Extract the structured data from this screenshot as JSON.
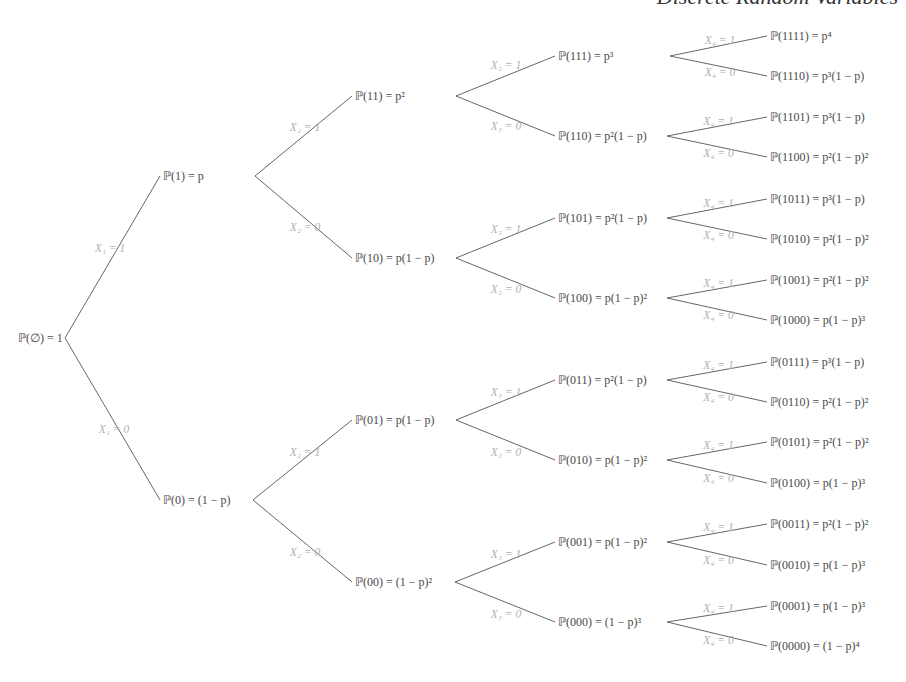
{
  "header": {
    "title": "Discrete Random Variables"
  },
  "tree": {
    "root": {
      "label": "ℙ(∅) = 1",
      "x": 18,
      "y": 338,
      "bx": 65
    },
    "levels": [
      {
        "nodes": [
          {
            "id": "1",
            "label": "ℙ(1) = p",
            "x": 163,
            "y": 176,
            "bx": 255,
            "edge": "X₁ = 1",
            "ex": 110,
            "ey": 248
          },
          {
            "id": "0",
            "label": "ℙ(0) = (1 − p)",
            "x": 163,
            "y": 500,
            "bx": 253,
            "edge": "X₁ = 0",
            "ex": 114,
            "ey": 429
          }
        ]
      },
      {
        "nodes": [
          {
            "id": "11",
            "label": "ℙ(11) = p²",
            "x": 355,
            "y": 96,
            "bx": 456,
            "edge": "X₂ = 1",
            "ex": 305,
            "ey": 127,
            "parent": 0
          },
          {
            "id": "10",
            "label": "ℙ(10) = p(1 − p)",
            "x": 355,
            "y": 258,
            "bx": 456,
            "edge": "X₂ = 0",
            "ex": 305,
            "ey": 227,
            "parent": 0
          },
          {
            "id": "01",
            "label": "ℙ(01) = p(1 − p)",
            "x": 355,
            "y": 420,
            "bx": 456,
            "edge": "X₂ = 1",
            "ex": 305,
            "ey": 452,
            "parent": 1
          },
          {
            "id": "00",
            "label": "ℙ(00) = (1 − p)²",
            "x": 355,
            "y": 582,
            "bx": 455,
            "edge": "X₂ = 0",
            "ex": 305,
            "ey": 552,
            "parent": 1
          }
        ]
      },
      {
        "nodes": [
          {
            "id": "111",
            "label": "ℙ(111) = p³",
            "x": 558,
            "y": 56,
            "bx": 670,
            "edge": "X₃ = 1",
            "ex": 506,
            "ey": 65,
            "parent": 0
          },
          {
            "id": "110",
            "label": "ℙ(110) = p²(1 − p)",
            "x": 558,
            "y": 136,
            "bx": 667,
            "edge": "X₃ = 0",
            "ex": 506,
            "ey": 126,
            "parent": 0
          },
          {
            "id": "101",
            "label": "ℙ(101) = p²(1 − p)",
            "x": 558,
            "y": 218,
            "bx": 667,
            "edge": "X₃ = 1",
            "ex": 506,
            "ey": 229,
            "parent": 1
          },
          {
            "id": "100",
            "label": "ℙ(100) = p(1 − p)²",
            "x": 558,
            "y": 298,
            "bx": 667,
            "edge": "X₃ = 0",
            "ex": 506,
            "ey": 289,
            "parent": 1
          },
          {
            "id": "011",
            "label": "ℙ(011) = p²(1 − p)",
            "x": 558,
            "y": 380,
            "bx": 667,
            "edge": "X₃ = 1",
            "ex": 506,
            "ey": 392,
            "parent": 2
          },
          {
            "id": "010",
            "label": "ℙ(010) = p(1 − p)²",
            "x": 558,
            "y": 460,
            "bx": 667,
            "edge": "X₃ = 0",
            "ex": 506,
            "ey": 452,
            "parent": 2
          },
          {
            "id": "001",
            "label": "ℙ(001) = p(1 − p)²",
            "x": 558,
            "y": 542,
            "bx": 667,
            "edge": "X₃ = 1",
            "ex": 506,
            "ey": 554,
            "parent": 3
          },
          {
            "id": "000",
            "label": "ℙ(000) = (1 − p)³",
            "x": 558,
            "y": 622,
            "bx": 667,
            "edge": "X₃ = 0",
            "ex": 506,
            "ey": 614,
            "parent": 3
          }
        ]
      },
      {
        "nodes": [
          {
            "id": "1111",
            "label": "ℙ(1111) = p⁴",
            "x": 770,
            "y": 36,
            "edge": "X₄ = 1",
            "ex": 720,
            "ey": 36,
            "parent": 0
          },
          {
            "id": "1110",
            "label": "ℙ(1110) = p³(1 − p)",
            "x": 770,
            "y": 76,
            "edge": "X₄ = 0",
            "ex": 720,
            "ey": 76,
            "parent": 0
          },
          {
            "id": "1101",
            "label": "ℙ(1101) = p³(1 − p)",
            "x": 770,
            "y": 117,
            "edge": "X₄ = 1",
            "ex": 720,
            "ey": 117,
            "parent": 1
          },
          {
            "id": "1100",
            "label": "ℙ(1100) = p²(1 − p)²",
            "x": 770,
            "y": 157,
            "edge": "X₄ = 0",
            "ex": 720,
            "ey": 157,
            "parent": 1
          },
          {
            "id": "1011",
            "label": "ℙ(1011) = p³(1 − p)",
            "x": 770,
            "y": 199,
            "edge": "X₄ = 1",
            "ex": 720,
            "ey": 199,
            "parent": 2
          },
          {
            "id": "1010",
            "label": "ℙ(1010) = p²(1 − p)²",
            "x": 770,
            "y": 239,
            "edge": "X₄ = 0",
            "ex": 720,
            "ey": 239,
            "parent": 2
          },
          {
            "id": "1001",
            "label": "ℙ(1001) = p²(1 − p)²",
            "x": 770,
            "y": 280,
            "edge": "X₄ = 1",
            "ex": 720,
            "ey": 280,
            "parent": 3
          },
          {
            "id": "1000",
            "label": "ℙ(1000) = p(1 − p)³",
            "x": 770,
            "y": 320,
            "edge": "X₄ = 0",
            "ex": 720,
            "ey": 320,
            "parent": 3
          },
          {
            "id": "0111",
            "label": "ℙ(0111) = p³(1 − p)",
            "x": 770,
            "y": 362,
            "edge": "X₄ = 1",
            "ex": 720,
            "ey": 362,
            "parent": 4
          },
          {
            "id": "0110",
            "label": "ℙ(0110) = p²(1 − p)²",
            "x": 770,
            "y": 402,
            "edge": "X₄ = 0",
            "ex": 720,
            "ey": 402,
            "parent": 4
          },
          {
            "id": "0101",
            "label": "ℙ(0101) = p²(1 − p)²",
            "x": 770,
            "y": 442,
            "edge": "X₄ = 1",
            "ex": 720,
            "ey": 442,
            "parent": 5
          },
          {
            "id": "0100",
            "label": "ℙ(0100) = p(1 − p)³",
            "x": 770,
            "y": 483,
            "edge": "X₄ = 0",
            "ex": 720,
            "ey": 483,
            "parent": 5
          },
          {
            "id": "0011",
            "label": "ℙ(0011) = p²(1 − p)²",
            "x": 770,
            "y": 524,
            "edge": "X₄ = 1",
            "ex": 720,
            "ey": 524,
            "parent": 6
          },
          {
            "id": "0010",
            "label": "ℙ(0010) = p(1 − p)³",
            "x": 770,
            "y": 565,
            "edge": "X₄ = 0",
            "ex": 720,
            "ey": 565,
            "parent": 6
          },
          {
            "id": "0001",
            "label": "ℙ(0001) = p(1 − p)³",
            "x": 770,
            "y": 606,
            "edge": "X₄ = 1",
            "ex": 720,
            "ey": 606,
            "parent": 7
          },
          {
            "id": "0000",
            "label": "ℙ(0000) = (1 − p)⁴",
            "x": 770,
            "y": 646,
            "edge": "X₄ = 0",
            "ex": 720,
            "ey": 646,
            "parent": 7
          }
        ]
      }
    ],
    "colors": {
      "line": "#666666",
      "node_text": "#4a4a4a",
      "edge_text": "#b0b0b0"
    }
  }
}
